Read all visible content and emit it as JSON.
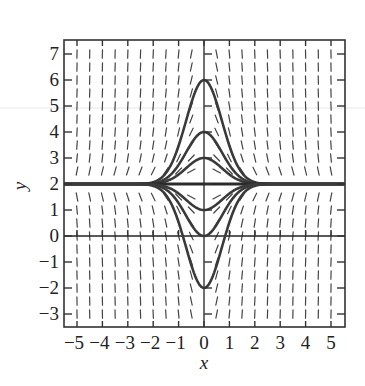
{
  "chart_data": {
    "type": "line",
    "subtype": "slope-field-with-solution-curves",
    "title": "",
    "xlabel": "x",
    "ylabel": "y",
    "xlim": [
      -5.5,
      5.5
    ],
    "ylim": [
      -3.5,
      7.5
    ],
    "x_ticks": [
      -5,
      -4,
      -3,
      -2,
      -1,
      0,
      1,
      2,
      3,
      4,
      5
    ],
    "x_tick_labels": [
      "−5",
      "−4",
      "−3",
      "−2",
      "−1",
      "0",
      "1",
      "2",
      "3",
      "4",
      "5"
    ],
    "y_ticks": [
      -3,
      -2,
      -1,
      0,
      1,
      2,
      3,
      4,
      5,
      6,
      7
    ],
    "y_tick_labels": [
      "−3",
      "−2",
      "−1",
      "0",
      "1",
      "2",
      "3",
      "4",
      "5",
      "6",
      "7"
    ],
    "grid": false,
    "legend": null,
    "slope_field": {
      "equation": "dy/dx = -2x(y - 2)",
      "x_range": [
        -5,
        5
      ],
      "y_range": [
        -3,
        7
      ],
      "step": 0.5
    },
    "equilibrium": {
      "y": 2
    },
    "series": [
      {
        "name": "y(0)=6",
        "formula": "y = 2 + 4e^(-x^2)",
        "peak": [
          0,
          6
        ]
      },
      {
        "name": "y(0)=4",
        "formula": "y = 2 + 2e^(-x^2)",
        "peak": [
          0,
          4
        ]
      },
      {
        "name": "y(0)=3",
        "formula": "y = 2 + 1e^(-x^2)",
        "peak": [
          0,
          3
        ]
      },
      {
        "name": "y(0)=2",
        "formula": "y = 2",
        "peak": [
          0,
          2
        ]
      },
      {
        "name": "y(0)=1",
        "formula": "y = 2 - 1e^(-x^2)",
        "peak": [
          0,
          1
        ]
      },
      {
        "name": "y(0)=0",
        "formula": "y = 2 - 2e^(-x^2)",
        "peak": [
          0,
          0
        ]
      },
      {
        "name": "y(0)=-2",
        "formula": "y = 2 - 4e^(-x^2)",
        "peak": [
          0,
          -2
        ]
      }
    ],
    "curve_constants": [
      4,
      2,
      1,
      0,
      -1,
      -2,
      -4
    ]
  },
  "layout": {
    "plot_left": 64,
    "plot_top": 40,
    "plot_right": 345,
    "plot_bottom": 327,
    "x0_px": 204,
    "x_unit_px": 25.4,
    "y0_px": 236,
    "y_unit_px": 26.0
  }
}
